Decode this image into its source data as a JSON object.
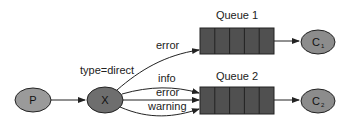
{
  "diagram": {
    "exchange_type_label": "type=direct",
    "producer": {
      "label": "P",
      "color": "#9a9a9a"
    },
    "exchange": {
      "label": "X",
      "color": "#6e6e6e"
    },
    "queues": [
      {
        "title": "Queue 1",
        "cells": 5,
        "color": "#505050"
      },
      {
        "title": "Queue 2",
        "cells": 5,
        "color": "#505050"
      }
    ],
    "consumers": [
      {
        "label": "C",
        "subscript": "1",
        "color": "#8c8c8c"
      },
      {
        "label": "C",
        "subscript": "2",
        "color": "#8c8c8c"
      }
    ],
    "bindings": [
      {
        "routing_key": "error",
        "queue": "Queue 1"
      },
      {
        "routing_key": "info",
        "queue": "Queue 2"
      },
      {
        "routing_key": "error",
        "queue": "Queue 2"
      },
      {
        "routing_key": "warning",
        "queue": "Queue 2"
      }
    ]
  }
}
